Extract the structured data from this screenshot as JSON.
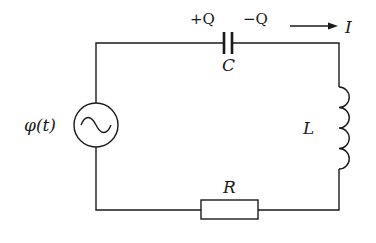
{
  "diagram": {
    "type": "circuit",
    "components": {
      "source": {
        "label": "φ(t)",
        "kind": "ac-voltage-source",
        "symbol": "~"
      },
      "capacitor": {
        "label": "C",
        "plus_label": "+Q",
        "minus_label": "−Q"
      },
      "inductor": {
        "label": "L",
        "turns": 4
      },
      "resistor": {
        "label": "R"
      }
    },
    "current": {
      "label": "I",
      "direction": "right"
    },
    "colors": {
      "line": "#1a1a1a",
      "background": "#ffffff"
    }
  }
}
